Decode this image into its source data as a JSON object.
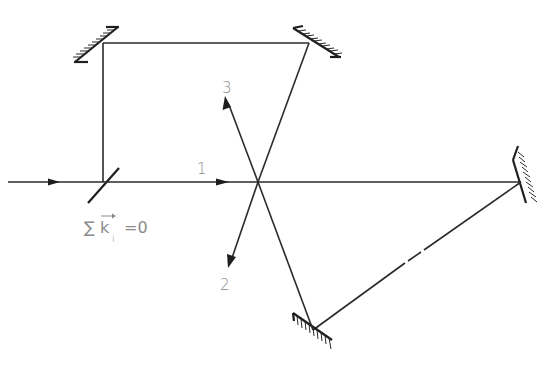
{
  "diagram": {
    "type": "optical-setup",
    "beam_labels": {
      "beam1": "1",
      "beam2": "2",
      "beam3": "3"
    },
    "condition": {
      "text": "∑k⃗ᵢ =0",
      "sum_symbol": "∑",
      "vector": "k",
      "subscript": "i",
      "equals": "=0"
    },
    "components": [
      {
        "name": "input-beam",
        "kind": "beam"
      },
      {
        "name": "beam-splitter",
        "kind": "splitter"
      },
      {
        "name": "mirror-top-left",
        "kind": "mirror"
      },
      {
        "name": "mirror-top-right",
        "kind": "mirror"
      },
      {
        "name": "mirror-right",
        "kind": "mirror"
      },
      {
        "name": "mirror-bottom",
        "kind": "mirror"
      },
      {
        "name": "crossing-point",
        "kind": "interaction-region"
      }
    ],
    "colors": {
      "line": "#2a2a2a",
      "label": "#8a8a8a",
      "background": "#ffffff"
    }
  }
}
